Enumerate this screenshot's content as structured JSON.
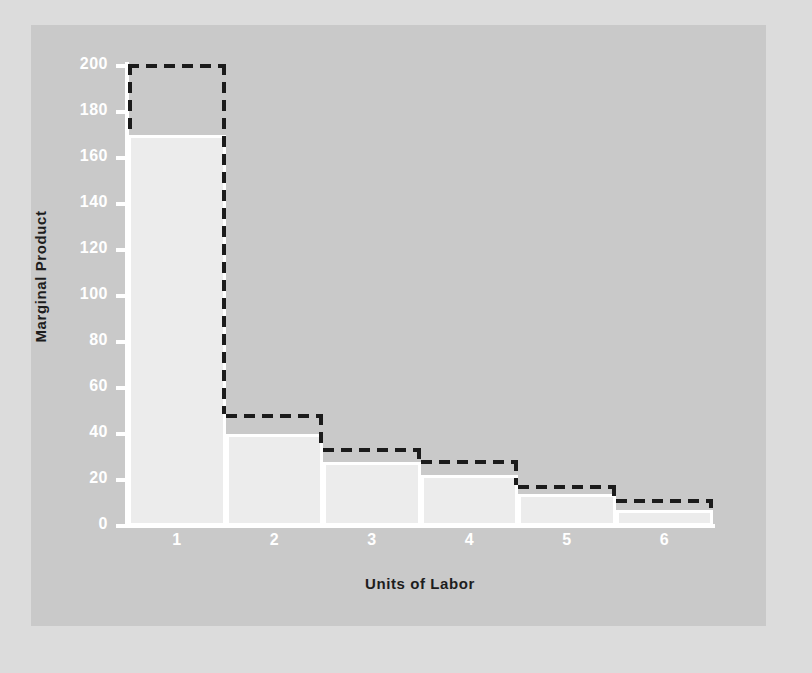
{
  "chart_data": {
    "type": "bar",
    "title": "",
    "xlabel": "Units of Labor",
    "ylabel": "Marginal Product",
    "categories": [
      "1",
      "2",
      "3",
      "4",
      "5",
      "6"
    ],
    "series": [
      {
        "name": "Marginal Product (bar)",
        "values": [
          170,
          40,
          28,
          22,
          14,
          7
        ]
      },
      {
        "name": "Marginal Product (dashed step)",
        "values": [
          200,
          48,
          33,
          28,
          17,
          11
        ]
      }
    ],
    "ylim": [
      0,
      200
    ],
    "yticks": [
      0,
      20,
      40,
      60,
      80,
      100,
      120,
      140,
      160,
      180,
      200
    ],
    "ytick_labels": [
      "0",
      "20",
      "40",
      "60",
      "80",
      "100",
      "120",
      "140",
      "160",
      "180",
      "200"
    ],
    "grid": false,
    "legend": "none",
    "colors": {
      "panel_background": "#c9c9c9",
      "outer_background": "#dcdcdc",
      "bar_fill": "#ececec",
      "bar_border": "#ffffff",
      "axis": "#ffffff",
      "tick_label": "#ffffff",
      "dashed_line": "#1b1b1b",
      "axis_title": "#1d1d1d"
    }
  }
}
